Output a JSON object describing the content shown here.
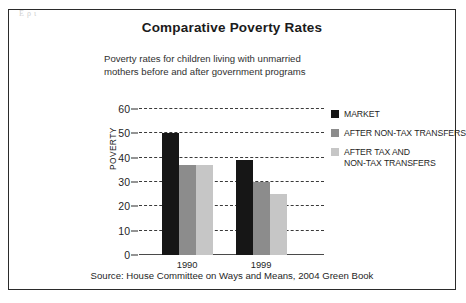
{
  "figure": {
    "title": "Comparative Poverty Rates",
    "subtitle_lines": [
      "Poverty rates for children living with unmarried",
      "mothers before and after government programs"
    ],
    "source_note": "Source:  House Committee on Ways and Means, 2004 Green Book",
    "scan_artifact": "Ερι"
  },
  "chart_data": {
    "type": "bar",
    "title": "Comparative Poverty Rates",
    "subtitle": "Poverty rates for children living with unmarried mothers before and after government programs",
    "xlabel": "",
    "ylabel": "POVERTY",
    "categories": [
      "1990",
      "1999"
    ],
    "series": [
      {
        "name": "MARKET",
        "color": "#161616",
        "values": [
          50,
          39
        ]
      },
      {
        "name": "AFTER NON-TAX TRANSFERS",
        "color": "#8c8c8c",
        "values": [
          37,
          30
        ]
      },
      {
        "name": "AFTER TAX AND NON-TAX TRANSFERS",
        "color": "#c6c6c6",
        "values": [
          37,
          25
        ]
      }
    ],
    "ylim": [
      0,
      60
    ],
    "yticks": [
      0,
      10,
      20,
      30,
      40,
      50,
      60
    ],
    "ytick_labels": [
      "0",
      "10",
      "20",
      "30",
      "40",
      "50",
      "60"
    ],
    "grid": "horizontal-dashed",
    "legend_position": "right",
    "legend_entries": [
      {
        "label_lines": [
          "MARKET"
        ],
        "color": "#161616"
      },
      {
        "label_lines": [
          "AFTER NON-TAX TRANSFERS"
        ],
        "color": "#8c8c8c"
      },
      {
        "label_lines": [
          "AFTER TAX AND",
          "NON-TAX TRANSFERS"
        ],
        "color": "#c6c6c6"
      }
    ],
    "source": "Source:  House Committee on Ways and Means, 2004 Green Book"
  }
}
